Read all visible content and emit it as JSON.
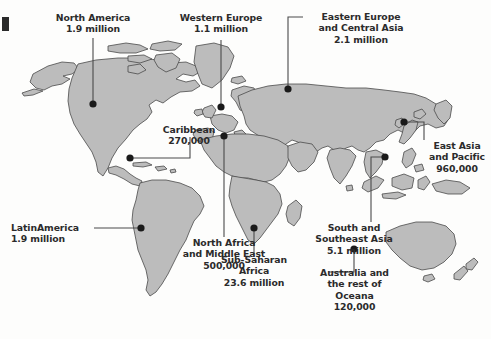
{
  "figure": {
    "type": "annotated-world-map",
    "background_color": "#fdfdfc",
    "land_fill": "#bcbcbc",
    "land_stroke": "#4a4a4a",
    "text_color": "#2b2b2b",
    "marker_color": "#1a1a1a",
    "leader_color": "#4a4a4a"
  },
  "regions": [
    {
      "id": "north-america",
      "name": "North America",
      "value": "1.9 million",
      "label_lines": [
        "North America",
        "1.9 million"
      ]
    },
    {
      "id": "western-europe",
      "name": "Western Europe",
      "value": "1.1 million",
      "label_lines": [
        "Western Europe",
        "1.1 million"
      ]
    },
    {
      "id": "eastern-europe-central-asia",
      "name": "Eastern Europe and Central Asia",
      "value": "2.1 million",
      "label_lines": [
        "Eastern Europe",
        "and Central Asia",
        "2.1 million"
      ]
    },
    {
      "id": "caribbean",
      "name": "Caribbean",
      "value": "270,000",
      "label_lines": [
        "Caribbean",
        "270,000"
      ]
    },
    {
      "id": "east-asia-pacific",
      "name": "East Asia and Pacific",
      "value": "960,000",
      "label_lines": [
        "East Asia",
        "and Pacific",
        "960,000"
      ]
    },
    {
      "id": "latin-america",
      "name": "LatinAmerica",
      "value": "1.9 million",
      "label_lines": [
        "LatinAmerica",
        "1.9 million"
      ]
    },
    {
      "id": "north-africa-middle-east",
      "name": "North Africa and Middle East",
      "value": "500,000",
      "label_lines": [
        "North Africa",
        "and Middle East",
        "500,000"
      ]
    },
    {
      "id": "south-southeast-asia",
      "name": "South and Southeast Asia",
      "value": "5.1 million",
      "label_lines": [
        "South and",
        "Southeast Asia",
        "5.1 million"
      ]
    },
    {
      "id": "sub-saharan-africa",
      "name": "Sub-Saharan Africa",
      "value": "23.6 million",
      "label_lines": [
        "Sub-Saharan",
        "Africa",
        "23.6 million"
      ]
    },
    {
      "id": "australia-oceana",
      "name": "Australia and the rest of Oceana",
      "value": "120,000",
      "label_lines": [
        "Australia and",
        "the rest of",
        "Oceana",
        "120,000"
      ]
    }
  ]
}
